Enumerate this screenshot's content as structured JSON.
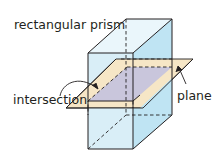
{
  "diagram": {
    "type": "geometry-3d",
    "labels": {
      "prism": "rectangular prism",
      "intersection": "intersection",
      "plane": "plane"
    },
    "colors": {
      "front_face": "#d9eef7",
      "side_face": "#bfe4f3",
      "top_face": "#eaf6fb",
      "plane_fill": "#f6e6c6",
      "intersection_fill": "#c9c6dc",
      "edge": "#231f20"
    },
    "shapes": {
      "prism_front_face": "88,53 133,53 133,149 88,149",
      "prism_side_face": "133,53 172,19 172,115 133,149",
      "prism_top_face": "88,53 126,19 172,19 133,53",
      "plane": "66,108 143,108 193,59 116,59",
      "intersection": "88,101 133,101 172,67 127,67"
    }
  }
}
